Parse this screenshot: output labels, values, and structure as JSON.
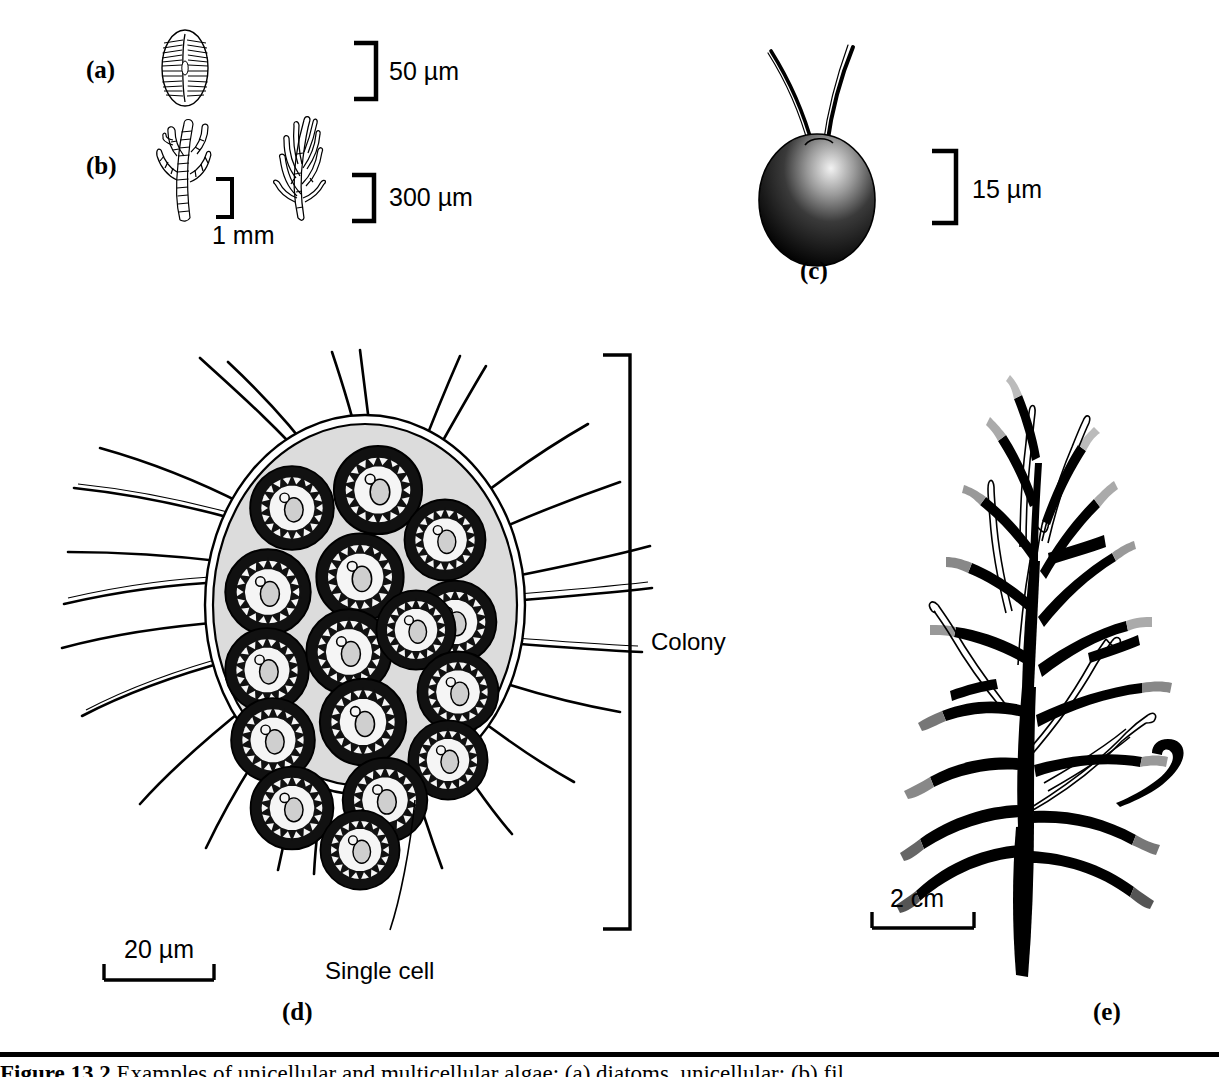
{
  "figure": {
    "caption_number": "Figure 13.2",
    "caption_text": "Examples of unicellular and multicellular algae: (a) diatoms, unicellular; (b) fil"
  },
  "panels": {
    "a": {
      "letter": "(a)",
      "subject": "diatom-unicellular",
      "scale": {
        "label": "50 µm",
        "value": 50,
        "unit": "µm",
        "orientation": "vertical-bracket"
      }
    },
    "b": {
      "letter": "(b)",
      "subject": "filamentous-multicellular-algae",
      "scales": [
        {
          "label": "1 mm",
          "value": 1,
          "unit": "mm",
          "orientation": "vertical-bracket"
        },
        {
          "label": "300 µm",
          "value": 300,
          "unit": "µm",
          "orientation": "vertical-bracket"
        }
      ]
    },
    "c": {
      "letter": "(c)",
      "subject": "biflagellate-unicellular-alga",
      "scale": {
        "label": "15 µm",
        "value": 15,
        "unit": "µm",
        "orientation": "vertical-bracket"
      }
    },
    "d": {
      "letter": "(d)",
      "subject": "colonial-alga",
      "annotations": [
        {
          "id": "colony",
          "label": "Colony"
        },
        {
          "id": "single-cell",
          "label": "Single cell"
        }
      ],
      "scale": {
        "label": "20 µm",
        "value": 20,
        "unit": "µm",
        "orientation": "horizontal-bar"
      },
      "cell_count": 16
    },
    "e": {
      "letter": "(e)",
      "subject": "branched-macroalga-thallus",
      "scale": {
        "label": "2 cm",
        "value": 2,
        "unit": "cm",
        "orientation": "horizontal-bar"
      }
    }
  },
  "colors": {
    "ink": "#000000",
    "paper": "#ffffff",
    "colony_matrix": "#d8d8d8",
    "cell_interior": "#f2f2f2",
    "nucleus": "#c9c9c9"
  }
}
